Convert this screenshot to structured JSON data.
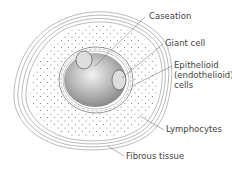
{
  "diagram": {
    "type": "granuloma-cross-section",
    "labels": [
      {
        "id": "caseation",
        "text": "Caseation"
      },
      {
        "id": "giant-cell",
        "text": "Giant cell"
      },
      {
        "id": "epithelioid-1",
        "text": "Epithelioid"
      },
      {
        "id": "epithelioid-2",
        "text": "(endothelioid)"
      },
      {
        "id": "epithelioid-3",
        "text": "cells"
      },
      {
        "id": "lymphocytes",
        "text": "Lymphocytes"
      },
      {
        "id": "fibrous",
        "text": "Fibrous tissue"
      }
    ]
  }
}
